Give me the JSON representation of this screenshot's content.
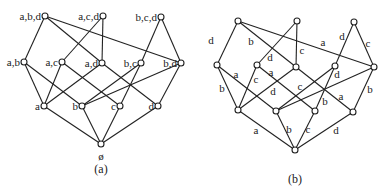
{
  "diagram_a": {
    "caption": "(a)",
    "nodes": [
      {
        "id": "abd",
        "label": "a,b,d"
      },
      {
        "id": "acd",
        "label": "a,c,d"
      },
      {
        "id": "bcd",
        "label": "b,c,d"
      },
      {
        "id": "ab",
        "label": "a,b"
      },
      {
        "id": "ac",
        "label": "a,c"
      },
      {
        "id": "ad",
        "label": "a,d"
      },
      {
        "id": "bc",
        "label": "b,c"
      },
      {
        "id": "bd",
        "label": "b,d"
      },
      {
        "id": "a",
        "label": "a"
      },
      {
        "id": "b",
        "label": "b"
      },
      {
        "id": "c",
        "label": "c"
      },
      {
        "id": "d",
        "label": "d"
      },
      {
        "id": "empty",
        "label": "ø"
      }
    ],
    "edges": [
      [
        "abd",
        "ab"
      ],
      [
        "abd",
        "ad"
      ],
      [
        "abd",
        "bd"
      ],
      [
        "acd",
        "ac"
      ],
      [
        "acd",
        "ad"
      ],
      [
        "bcd",
        "bc"
      ],
      [
        "bcd",
        "bd"
      ],
      [
        "ab",
        "a"
      ],
      [
        "ab",
        "b"
      ],
      [
        "ac",
        "a"
      ],
      [
        "ac",
        "c"
      ],
      [
        "ad",
        "a"
      ],
      [
        "ad",
        "d"
      ],
      [
        "bc",
        "b"
      ],
      [
        "bc",
        "c"
      ],
      [
        "bd",
        "b"
      ],
      [
        "bd",
        "d"
      ],
      [
        "a",
        "empty"
      ],
      [
        "b",
        "empty"
      ],
      [
        "c",
        "empty"
      ],
      [
        "d",
        "empty"
      ]
    ]
  },
  "diagram_b": {
    "caption": "(b)",
    "nodes": [
      "abd",
      "acd",
      "bcd",
      "ab",
      "ac",
      "ad",
      "bc",
      "bd",
      "a",
      "b",
      "c",
      "d",
      "empty"
    ],
    "edges": [
      {
        "from": "abd",
        "to": "ab",
        "label": "d"
      },
      {
        "from": "abd",
        "to": "ad",
        "label": "b"
      },
      {
        "from": "abd",
        "to": "bd",
        "label": "a"
      },
      {
        "from": "acd",
        "to": "ac",
        "label": "d"
      },
      {
        "from": "acd",
        "to": "ad",
        "label": "c"
      },
      {
        "from": "bcd",
        "to": "bc",
        "label": "d"
      },
      {
        "from": "bcd",
        "to": "bd",
        "label": "c"
      },
      {
        "from": "ab",
        "to": "a",
        "label": "b"
      },
      {
        "from": "ab",
        "to": "b",
        "label": "a"
      },
      {
        "from": "ac",
        "to": "a",
        "label": "c"
      },
      {
        "from": "ac",
        "to": "c",
        "label": "a"
      },
      {
        "from": "ad",
        "to": "a",
        "label": "d"
      },
      {
        "from": "ad",
        "to": "d",
        "label": "a"
      },
      {
        "from": "bc",
        "to": "b",
        "label": "c"
      },
      {
        "from": "bc",
        "to": "c",
        "label": "b"
      },
      {
        "from": "bd",
        "to": "b",
        "label": "d"
      },
      {
        "from": "bd",
        "to": "d",
        "label": "b"
      },
      {
        "from": "a",
        "to": "empty",
        "label": "a"
      },
      {
        "from": "b",
        "to": "empty",
        "label": "b"
      },
      {
        "from": "c",
        "to": "empty",
        "label": "c"
      },
      {
        "from": "d",
        "to": "empty",
        "label": "d"
      }
    ]
  }
}
